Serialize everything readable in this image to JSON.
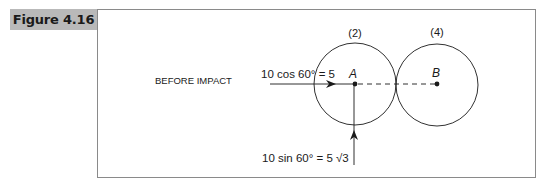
{
  "figure": {
    "label": "Figure 4.16",
    "label_bg": "#b9b9b9",
    "frame_border": "#8a8a8a"
  },
  "diagram": {
    "caption": "BEFORE IMPACT",
    "ball_a": {
      "label": "A",
      "mass_label": "(2)",
      "center": [
        355,
        84
      ],
      "radius": 41
    },
    "ball_b": {
      "label": "B",
      "mass_label": "(4)",
      "center": [
        437,
        85
      ],
      "radius": 41
    },
    "horizontal_component": {
      "label": "10 cos 60° = 5",
      "from": [
        270,
        84
      ],
      "to": [
        355,
        84
      ]
    },
    "vertical_component": {
      "label": "10 sin 60° = 5 √3",
      "from": [
        354,
        165
      ],
      "to": [
        354,
        84
      ]
    },
    "line_of_centers": {
      "style": "dashed",
      "from": [
        355,
        84
      ],
      "to": [
        437,
        84
      ]
    }
  }
}
